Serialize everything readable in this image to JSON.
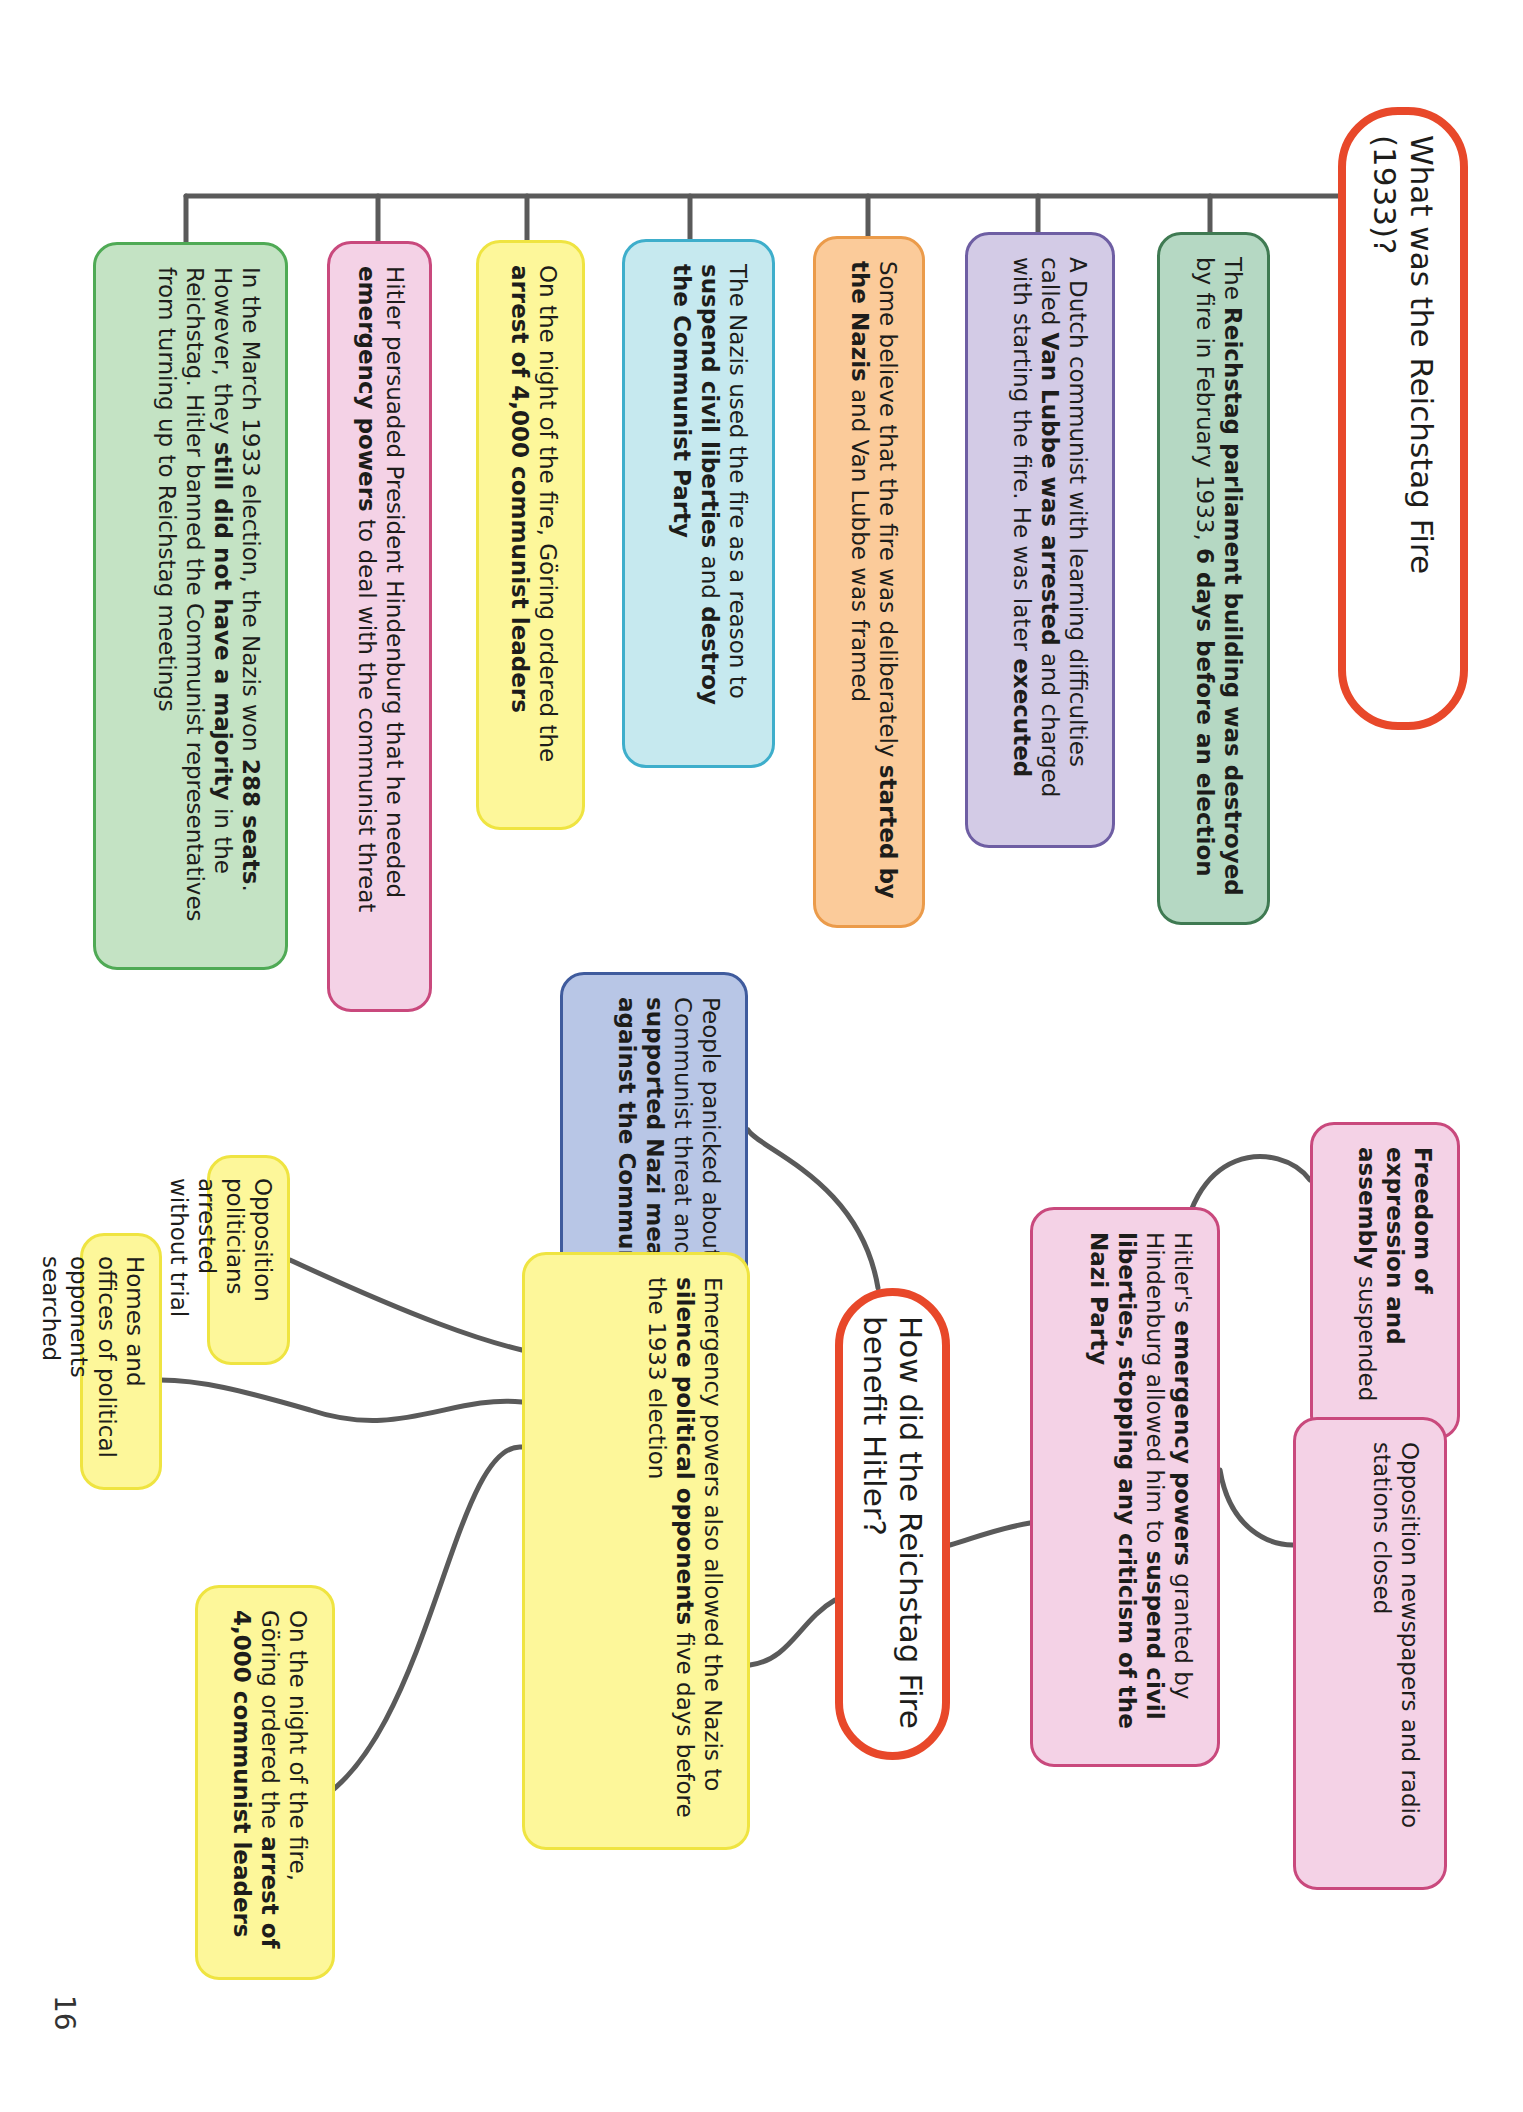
{
  "page_number": "16",
  "section1": {
    "title": "What was the Reichstag Fire (1933)?",
    "boxes": [
      {
        "parts": [
          [
            "The ",
            false
          ],
          [
            "Reichstag parliament building was destroyed",
            true
          ],
          [
            " by fire in February 1933, ",
            false
          ],
          [
            "6 days before an election",
            true
          ]
        ]
      },
      {
        "parts": [
          [
            "A Dutch communist with learning difficulties called ",
            false
          ],
          [
            "Van Lubbe was arrested",
            true
          ],
          [
            " and charged with starting the fire. He was later ",
            false
          ],
          [
            "executed",
            true
          ]
        ]
      },
      {
        "parts": [
          [
            "Some believe that the fire was deliberately ",
            false
          ],
          [
            "started by the Nazis",
            true
          ],
          [
            " and Van Lubbe was framed",
            false
          ]
        ]
      },
      {
        "parts": [
          [
            "The Nazis used the fire as a reason to ",
            false
          ],
          [
            "suspend civil liberties",
            true
          ],
          [
            " and ",
            false
          ],
          [
            "destroy the Communist Party",
            true
          ]
        ]
      },
      {
        "parts": [
          [
            "On the night of the fire, Göring ordered the ",
            false
          ],
          [
            "arrest of 4,000 communist leaders",
            true
          ]
        ]
      },
      {
        "parts": [
          [
            "Hitler persuaded President Hindenburg that he needed ",
            false
          ],
          [
            "emergency powers",
            true
          ],
          [
            " to deal with the communist threat",
            false
          ]
        ]
      },
      {
        "parts": [
          [
            "In the March 1933 election, the Nazis won ",
            false
          ],
          [
            "288 seats",
            true
          ],
          [
            ". However, they ",
            false
          ],
          [
            "still did not have a majority",
            true
          ],
          [
            " in the Reichstag. Hitler banned the Communist representatives from turning up to Reichstag meetings",
            false
          ]
        ]
      }
    ]
  },
  "section2": {
    "title": "How did the Reichstag Fire benefit Hitler?",
    "emergency": {
      "parts": [
        [
          "Hitler's ",
          false
        ],
        [
          "emergency powers",
          true
        ],
        [
          " granted by Hindenburg allowed him to ",
          false
        ],
        [
          "suspend civil liberties, stopping any criticism of the Nazi Party",
          true
        ]
      ]
    },
    "freedom": {
      "parts": [
        [
          "Freedom of expression and assembly",
          true
        ],
        [
          " suspended",
          false
        ]
      ]
    },
    "newspapers": {
      "parts": [
        [
          "Opposition newspapers and radio stations closed",
          false
        ]
      ]
    },
    "panicked": {
      "parts": [
        [
          "People panicked about the Communist threat and so ",
          false
        ],
        [
          "supported Nazi measures against the Communists",
          true
        ]
      ]
    },
    "silence": {
      "parts": [
        [
          "Emergency powers also allowed the Nazis to ",
          false
        ],
        [
          "silence political opponents",
          true
        ],
        [
          " five days before the 1933 election",
          false
        ]
      ]
    },
    "arrested": {
      "parts": [
        [
          "Opposition politicians arrested without trial",
          false
        ]
      ]
    },
    "homes": {
      "parts": [
        [
          "Homes and offices of political opponents searched",
          false
        ]
      ]
    },
    "night": {
      "parts": [
        [
          "On the night of the fire, Göring ordered the ",
          false
        ],
        [
          "arrest of 4,000 communist leaders",
          true
        ]
      ]
    }
  },
  "colors": {
    "title_border": "#e8482a",
    "connector": "#5a5a5a"
  }
}
